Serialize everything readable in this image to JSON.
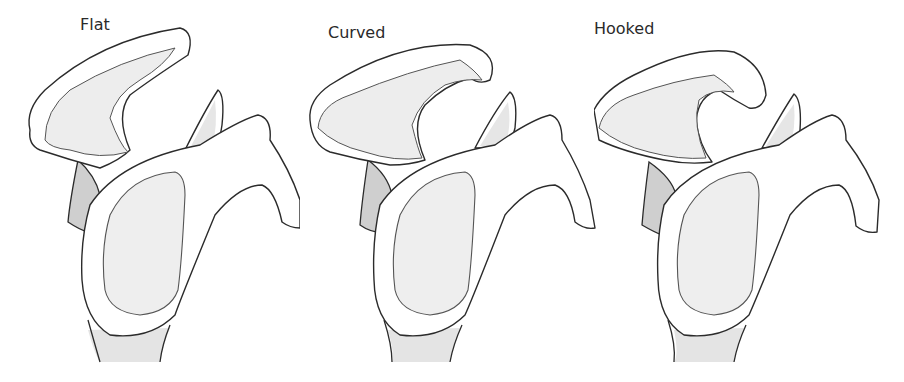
{
  "figure": {
    "panels": [
      {
        "label": "Flat",
        "type": "flat"
      },
      {
        "label": "Curved",
        "type": "curved"
      },
      {
        "label": "Hooked",
        "type": "hooked"
      }
    ]
  },
  "colors": {
    "background": "#ffffff",
    "outline": "#2b2b2b",
    "bone_fill": "#ffffff",
    "shadow_fill": "#e6e6e6",
    "glenoid_fill": "#eeeeee"
  }
}
